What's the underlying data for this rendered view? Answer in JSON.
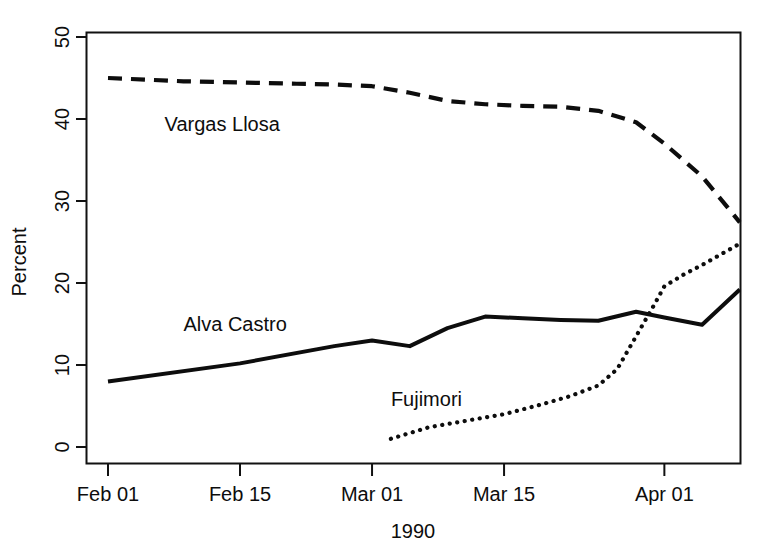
{
  "chart_data": {
    "type": "line",
    "title": "",
    "subtitle": "",
    "xlabel": "1990",
    "ylabel": "Percent",
    "grid": false,
    "legend_position": "inline-annotation",
    "ylim": [
      -1,
      51
    ],
    "xlim_days_from_feb01": [
      -2.3,
      68
    ],
    "ytick_labels": [
      "0",
      "10",
      "20",
      "30",
      "40",
      "50"
    ],
    "ytick_values": [
      0,
      10,
      20,
      30,
      40,
      50
    ],
    "xtick_labels": [
      "Feb 01",
      "Feb 15",
      "Mar 01",
      "Mar 15",
      "Apr 01"
    ],
    "xtick_days": [
      0,
      14,
      28,
      42,
      59
    ],
    "series": [
      {
        "name": "Vargas Llosa",
        "style": "dashed",
        "label_x_day": 6,
        "label_y_value": 38.5,
        "x": [
          0,
          4,
          8,
          12,
          16,
          20,
          24,
          28,
          32,
          36,
          40,
          44,
          48,
          52,
          56,
          59,
          63,
          67
        ],
        "values": [
          45.0,
          44.8,
          44.6,
          44.5,
          44.4,
          44.3,
          44.2,
          44.0,
          43.2,
          42.2,
          41.8,
          41.6,
          41.5,
          41.0,
          39.6,
          37.0,
          33.0,
          27.4
        ]
      },
      {
        "name": "Alva Castro",
        "style": "solid",
        "label_x_day": 8,
        "label_y_value": 14.2,
        "x": [
          0,
          14,
          24,
          28,
          32,
          36,
          40,
          44,
          48,
          52,
          56,
          59,
          63,
          67
        ],
        "values": [
          8.0,
          10.2,
          12.3,
          13.0,
          12.3,
          14.5,
          15.9,
          15.7,
          15.5,
          15.4,
          16.5,
          15.8,
          14.9,
          19.2
        ]
      },
      {
        "name": "Fujimori",
        "style": "dotted",
        "label_x_day": 30,
        "label_y_value": 5.0,
        "x": [
          30,
          34,
          38,
          42,
          46,
          49,
          52,
          54,
          56,
          58,
          59,
          61,
          63,
          65,
          67
        ],
        "values": [
          1.0,
          2.4,
          3.2,
          4.0,
          5.2,
          6.2,
          7.5,
          9.5,
          13.5,
          17.5,
          19.6,
          21.0,
          22.2,
          23.5,
          24.8
        ]
      }
    ]
  },
  "axes": {
    "y_title": "Percent",
    "x_title": "1990"
  }
}
